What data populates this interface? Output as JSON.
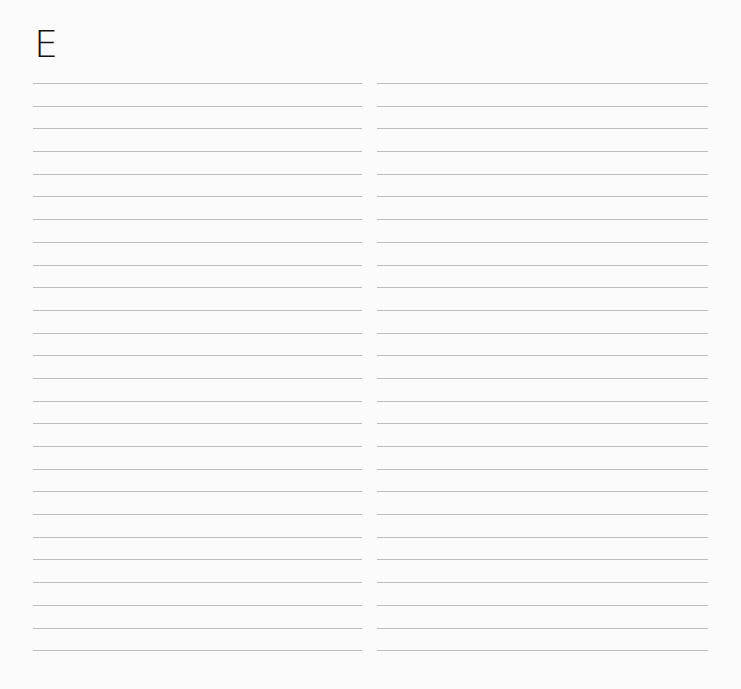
{
  "page": {
    "heading_letter": "E",
    "columns": 2,
    "lines_per_column": 26,
    "line_color": "#bdbdbd",
    "background": "#fbfbfb"
  }
}
